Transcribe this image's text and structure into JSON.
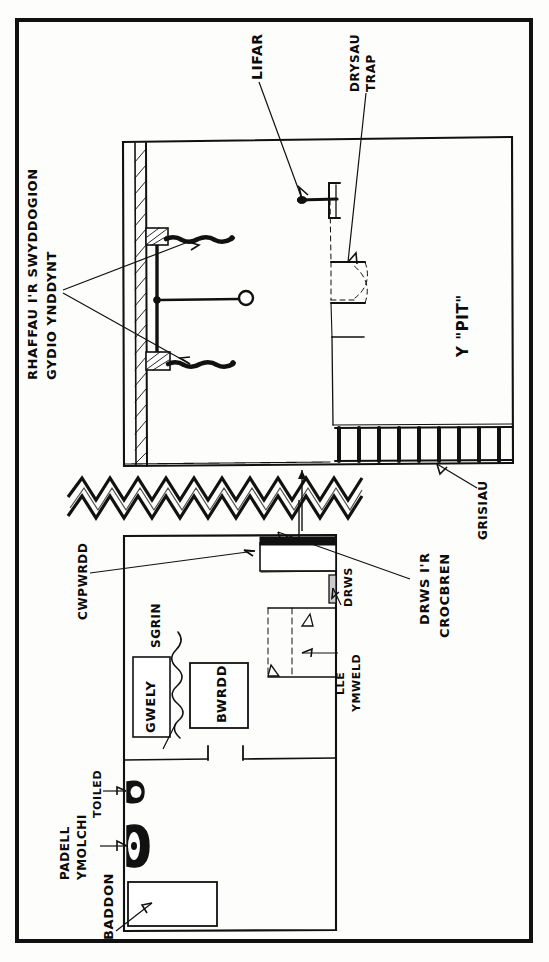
{
  "document": {
    "kind": "hand-drawn architectural sketch",
    "language": "Welsh",
    "orientation": "labels rotated 90 degrees (read bottom-to-top)",
    "ink_color": "#0b0b0b",
    "paper_color": "#fdfdfb"
  },
  "frame": {
    "border_color": "#111111",
    "border_width_px": 4
  },
  "upper_drawing": {
    "title": "execution chamber section",
    "labels": [
      {
        "id": "rhaffau",
        "text": "RHAFFAU I'R SWYDDOGION",
        "text_line2": "GYDIO YNDDYNT"
      },
      {
        "id": "lifar",
        "text": "LIFAR"
      },
      {
        "id": "drysau-trap",
        "text": "DRYSAU",
        "text_line2": "TRAP"
      },
      {
        "id": "y-pit",
        "text": "Y \"PIT\""
      },
      {
        "id": "grisiau",
        "text": "GRISIAU"
      }
    ],
    "stair_count": 9
  },
  "lower_drawing": {
    "title": "condemned cell floor plan",
    "labels": [
      {
        "id": "cwpwrdd",
        "text": "CWPWRDD"
      },
      {
        "id": "sgrin",
        "text": "SGRIN"
      },
      {
        "id": "gwely",
        "text": "GWELY"
      },
      {
        "id": "bwrdd",
        "text": "BWRDD"
      },
      {
        "id": "drws",
        "text": "DRWS"
      },
      {
        "id": "drws-ir-crocbren",
        "text": "DRWS I'R",
        "text_line2": "CROCBREN"
      },
      {
        "id": "lle-ymweld",
        "text": "LLE",
        "text_line2": "YMWELD"
      },
      {
        "id": "toiled",
        "text": "TOILED"
      },
      {
        "id": "padell-ymolchi",
        "text": "PADELL",
        "text_line2": "YMOLCHI"
      },
      {
        "id": "baddon",
        "text": "BADDON"
      }
    ]
  },
  "divider": {
    "id": "zigzag-separator",
    "type": "hand-drawn zigzag band",
    "peaks": 15
  }
}
